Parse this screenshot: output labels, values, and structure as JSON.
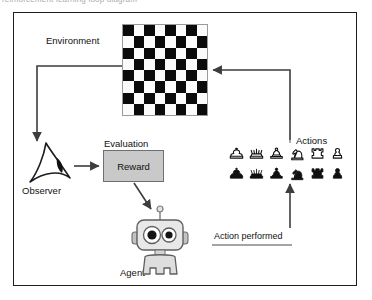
{
  "top_strip": {
    "clipped_text": "reinforcement learning loop diagram"
  },
  "diagram": {
    "title": "Reinforcement Learning Loop",
    "nodes": {
      "environment": {
        "label": "Environment",
        "icon": "chessboard-icon",
        "board": {
          "rows": 8,
          "cols": 8,
          "dark_color": "#0b0b0b",
          "light_color": "#fbfbfb"
        }
      },
      "observer": {
        "label": "Observer",
        "icon": "eye-icon"
      },
      "evaluation": {
        "label": "Evaluation",
        "icon": "evaluation-icon"
      },
      "reward": {
        "label": "Reward",
        "fill_color": "#c9c9c9",
        "border_color": "#6f6f6f"
      },
      "agent": {
        "label": "Agent",
        "icon": "robot-icon"
      },
      "actions": {
        "label": "Actions",
        "white_pieces": [
          "king",
          "queen",
          "bishop",
          "knight",
          "rook",
          "pawn"
        ],
        "black_pieces": [
          "king",
          "queen",
          "bishop",
          "knight",
          "rook",
          "pawn"
        ]
      },
      "action_performed": {
        "label": "Action performed"
      }
    },
    "edges": [
      {
        "name": "environment-to-observer",
        "from": "environment",
        "to": "observer"
      },
      {
        "name": "observer-to-evaluation",
        "from": "observer",
        "to": "evaluation"
      },
      {
        "name": "reward-to-agent",
        "from": "reward",
        "to": "agent"
      },
      {
        "name": "action-performed-to-actions",
        "from": "action_performed",
        "to": "actions"
      },
      {
        "name": "actions-to-environment",
        "from": "actions",
        "to": "environment"
      }
    ],
    "colors": {
      "frame": "#1d1d1d",
      "arrow": "#3d3d3d",
      "text": "#111111"
    }
  }
}
